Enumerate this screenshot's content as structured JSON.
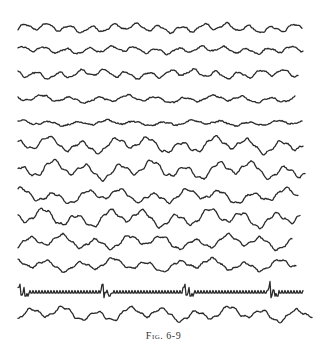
{
  "figure": {
    "caption": "Fig. 6-9",
    "stroke_color": "#2a2a2a",
    "background": "#ffffff",
    "x_start": 18,
    "traces": [
      {
        "id": 1,
        "baseline_y": 28,
        "x_end": 302,
        "amplitude": 5,
        "style": "irregular-fast"
      },
      {
        "id": 2,
        "baseline_y": 50,
        "x_end": 303,
        "amplitude": 4,
        "style": "irregular-fast"
      },
      {
        "id": 3,
        "baseline_y": 74,
        "x_end": 298,
        "amplitude": 5,
        "style": "irregular-fast"
      },
      {
        "id": 4,
        "baseline_y": 99,
        "x_end": 295,
        "amplitude": 4,
        "style": "irregular-low"
      },
      {
        "id": 5,
        "baseline_y": 123,
        "x_end": 302,
        "amplitude": 3,
        "style": "irregular-low"
      },
      {
        "id": 6,
        "baseline_y": 145,
        "x_end": 303,
        "amplitude": 9,
        "style": "slow-large"
      },
      {
        "id": 7,
        "baseline_y": 170,
        "x_end": 305,
        "amplitude": 10,
        "style": "slow-large"
      },
      {
        "id": 8,
        "baseline_y": 196,
        "x_end": 298,
        "amplitude": 8,
        "style": "slow-large"
      },
      {
        "id": 9,
        "baseline_y": 218,
        "x_end": 300,
        "amplitude": 10,
        "style": "slow-large"
      },
      {
        "id": 10,
        "baseline_y": 242,
        "x_end": 292,
        "amplitude": 8,
        "style": "slow-large"
      },
      {
        "id": 11,
        "baseline_y": 265,
        "x_end": 296,
        "amplitude": 7,
        "style": "slow-medium"
      },
      {
        "id": 12,
        "baseline_y": 292,
        "x_end": 303,
        "amplitude": 2,
        "style": "spike-and-fast",
        "spikes_x": [
          20,
          103,
          185,
          270
        ]
      },
      {
        "id": 13,
        "baseline_y": 314,
        "x_end": 312,
        "amplitude": 8,
        "style": "slow-medium"
      }
    ]
  }
}
